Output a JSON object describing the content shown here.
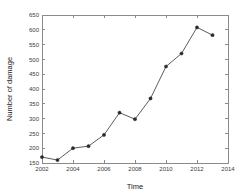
{
  "chart_data": {
    "type": "line",
    "title": "",
    "xlabel": "Time",
    "ylabel": "Number of damage",
    "x": [
      2002,
      2003,
      2004,
      2005,
      2006,
      2007,
      2008,
      2009,
      2010,
      2011,
      2012,
      2013
    ],
    "values": [
      170,
      160,
      200,
      207,
      245,
      320,
      298,
      368,
      476,
      520,
      608,
      582
    ],
    "series": [
      {
        "name": "Number of damage",
        "values": [
          170,
          160,
          200,
          207,
          245,
          320,
          298,
          368,
          476,
          520,
          608,
          582
        ]
      }
    ],
    "xlim": [
      2002,
      2014
    ],
    "ylim": [
      150,
      650
    ],
    "xticks": [
      2002,
      2004,
      2006,
      2008,
      2010,
      2012,
      2014
    ],
    "xtick_labels": [
      "2002",
      "2004",
      "2006",
      "2008",
      "2010",
      "2012",
      "2014"
    ],
    "yticks": [
      150,
      200,
      250,
      300,
      350,
      400,
      450,
      500,
      550,
      600,
      650
    ],
    "ytick_labels": [
      "150",
      "200",
      "250",
      "300",
      "350",
      "400",
      "450",
      "500",
      "550",
      "600",
      "650"
    ],
    "grid": false,
    "legend": "none",
    "marker": "filled-circle",
    "line_color": "#4a4a4a",
    "marker_color": "#2b2b2b",
    "axis_color": "#8a8a8a",
    "background": "#ffffff"
  }
}
